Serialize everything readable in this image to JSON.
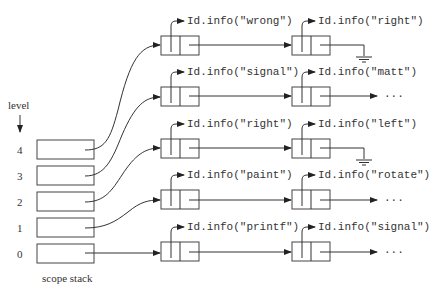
{
  "level_label": "level",
  "stack_label": "scope stack",
  "levels": [
    "4",
    "3",
    "2",
    "1",
    "0"
  ],
  "rows": [
    {
      "level": "4",
      "first": "Id.info(\"wrong\")",
      "second": "Id.info(\"right\")",
      "terminator": "ground"
    },
    {
      "level": "3",
      "first": "Id.info(\"signal\")",
      "second": "Id.info(\"matt\")",
      "terminator": "..."
    },
    {
      "level": "2",
      "first": "Id.info(\"right\")",
      "second": "Id.info(\"left\")",
      "terminator": "ground"
    },
    {
      "level": "1",
      "first": "Id.info(\"paint\")",
      "second": "Id.info(\"rotate\")",
      "terminator": "..."
    },
    {
      "level": "0",
      "first": "Id.info(\"printf\")",
      "second": "Id.info(\"signal\")",
      "terminator": "..."
    }
  ],
  "ellipsis": "···"
}
